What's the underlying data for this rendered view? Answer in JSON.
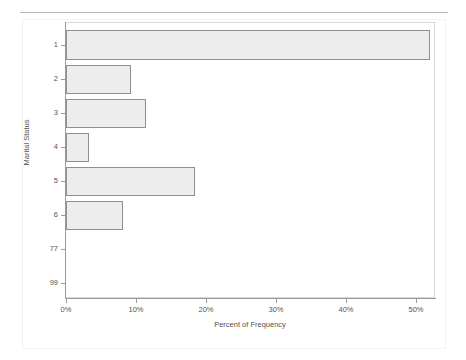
{
  "chart_data": {
    "type": "bar",
    "orientation": "horizontal",
    "title": "",
    "subtitle": "",
    "xlabel": "Percent of Frequency",
    "ylabel": "Marital Status",
    "categories": [
      "1",
      "2",
      "3",
      "4",
      "5",
      "6",
      "77",
      "99"
    ],
    "values": [
      52.1,
      9.3,
      11.4,
      3.3,
      18.4,
      8.2,
      0,
      0
    ],
    "xlim": [
      0,
      52.1
    ],
    "ylim": null,
    "xticks": [
      0,
      10,
      20,
      30,
      40,
      50
    ],
    "xtick_labels": [
      "0%",
      "10%",
      "20%",
      "30%",
      "40%",
      "50%"
    ],
    "ytick_labels": [
      "1",
      "2",
      "3",
      "4",
      "5",
      "6",
      "77",
      "99"
    ],
    "grid": false,
    "legend": null,
    "legend_position": "none",
    "series": [
      {
        "name": "Percent of Frequency",
        "values": [
          52.1,
          9.3,
          11.4,
          3.3,
          18.4,
          8.2,
          0,
          0
        ]
      }
    ],
    "annotations": []
  },
  "style": {
    "bar_fill": "#ededed",
    "bar_border": "#8f8f8f",
    "axis_color": "#9a9a9a",
    "frame_color": "#d8d8d8",
    "text_color": "#555555",
    "background": "#ffffff",
    "rule_color": "#b9b9b9"
  }
}
